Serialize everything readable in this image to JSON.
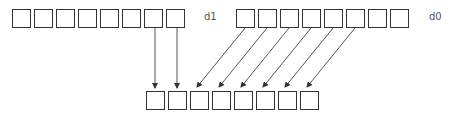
{
  "labels": {
    "d1": "d1",
    "d0": "d0"
  },
  "rows": {
    "d1": {
      "count": 8,
      "x0": 12,
      "y": 9,
      "pitch": 22
    },
    "d0": {
      "count": 8,
      "x0": 236,
      "y": 9,
      "pitch": 22
    },
    "out": {
      "count": 8,
      "x0": 146,
      "y": 91,
      "pitch": 22
    }
  },
  "colors": {
    "stroke": "#333333",
    "line": "#555555",
    "label": "#555555"
  },
  "arrows": [
    {
      "from": "d1[6]",
      "to": "out[0]"
    },
    {
      "from": "d1[7]",
      "to": "out[1]"
    },
    {
      "from": "d0[0]",
      "to": "out[2]"
    },
    {
      "from": "d0[1]",
      "to": "out[3]"
    },
    {
      "from": "d0[2]",
      "to": "out[4]"
    },
    {
      "from": "d0[3]",
      "to": "out[5]"
    },
    {
      "from": "d0[4]",
      "to": "out[6]"
    },
    {
      "from": "d0[5]",
      "to": "out[7]"
    }
  ]
}
